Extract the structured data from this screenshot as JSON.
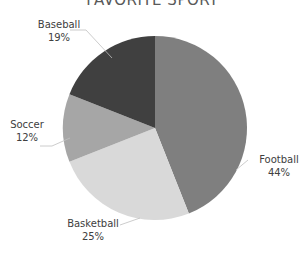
{
  "chart_data": {
    "type": "pie",
    "title": "FAVORITE SPORT",
    "categories": [
      "Football",
      "Basketball",
      "Soccer",
      "Baseball"
    ],
    "values": [
      44,
      25,
      12,
      19
    ],
    "labels": [
      "44%",
      "25%",
      "12%",
      "19%"
    ],
    "colors": [
      "#7f7f7f",
      "#d9d9d9",
      "#a6a6a6",
      "#404040"
    ],
    "start_angle_deg": 0,
    "direction": "clockwise",
    "legend": "none",
    "data_labels": "category name and percent, outside with leader lines"
  }
}
